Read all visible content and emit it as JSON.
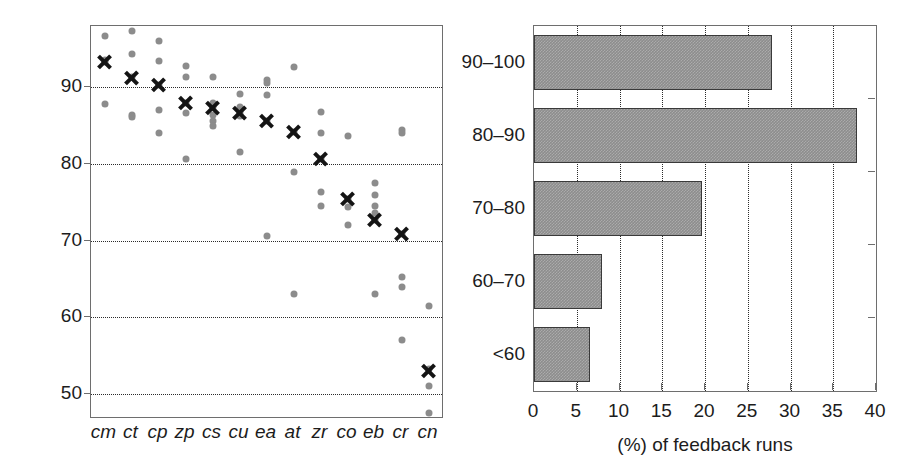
{
  "chart_data": [
    {
      "type": "scatter",
      "panel": "left",
      "title": "",
      "xlabel": "",
      "ylabel": "Feedback accuracy (%)",
      "ylim": [
        47,
        98
      ],
      "yticks": [
        50,
        60,
        70,
        80,
        90
      ],
      "grid": "horizontal-dotted",
      "legend": "none",
      "categories": [
        "cm",
        "ct",
        "cp",
        "zp",
        "cs",
        "cu",
        "ea",
        "at",
        "zr",
        "co",
        "eb",
        "cr",
        "cn"
      ],
      "series": [
        {
          "name": "mean",
          "marker": "x-cross",
          "color": "#141414",
          "values": [
            93.3,
            91.2,
            90.3,
            88.0,
            87.3,
            86.6,
            85.6,
            84.2,
            80.6,
            75.5,
            72.7,
            70.9,
            53.0
          ]
        },
        {
          "name": "individual runs",
          "marker": "dot",
          "color": "#8c8c8c",
          "points": [
            {
              "category": "cm",
              "values": [
                96.7,
                93.6,
                93.3,
                87.8
              ]
            },
            {
              "category": "ct",
              "values": [
                97.4,
                94.4,
                91.3,
                86.4,
                86.1
              ]
            },
            {
              "category": "cp",
              "values": [
                96.1,
                93.4,
                90.3,
                87.0,
                84.0
              ]
            },
            {
              "category": "zp",
              "values": [
                92.8,
                91.3,
                88.0,
                86.7,
                80.6
              ]
            },
            {
              "category": "cs",
              "values": [
                91.4,
                88.0,
                87.4,
                86.4,
                85.6,
                84.9
              ]
            },
            {
              "category": "cu",
              "values": [
                89.1,
                87.5,
                86.6,
                86.3,
                81.6
              ]
            },
            {
              "category": "ea",
              "values": [
                91.0,
                90.6,
                89.0,
                85.6,
                70.6
              ]
            },
            {
              "category": "at",
              "values": [
                92.6,
                84.2,
                79.0,
                63.0
              ]
            },
            {
              "category": "zr",
              "values": [
                86.8,
                84.0,
                80.6,
                76.3,
                74.5
              ]
            },
            {
              "category": "co",
              "values": [
                83.7,
                75.5,
                74.4,
                72.1
              ]
            },
            {
              "category": "eb",
              "values": [
                77.5,
                76.0,
                74.5,
                73.6,
                72.7,
                63.0
              ]
            },
            {
              "category": "cr",
              "values": [
                84.5,
                84.0,
                70.9,
                65.3,
                63.9,
                57.0
              ]
            },
            {
              "category": "cn",
              "values": [
                61.5,
                53.2,
                51.0,
                47.5
              ]
            }
          ]
        }
      ]
    },
    {
      "type": "bar",
      "panel": "right",
      "orientation": "horizontal",
      "title": "",
      "xlabel": "(%) of feedback runs",
      "ylabel": "",
      "categories": [
        "90–100",
        "80–90",
        "70–80",
        "60–70",
        "<60"
      ],
      "values": [
        27.8,
        37.8,
        19.7,
        8.0,
        6.5
      ],
      "xlim": [
        0,
        40
      ],
      "xticks": [
        0,
        5,
        10,
        15,
        20,
        25,
        30,
        35,
        40
      ],
      "xtick_labels": [
        "0",
        "5",
        "10",
        "15",
        "20",
        "25",
        "30",
        "35",
        "40"
      ],
      "grid": "vertical-dotted",
      "legend": "none",
      "bar_color": "#8d8d8d",
      "bar_edge_color": "#3a3a3a"
    }
  ],
  "colors": {
    "dot": "#8c8c8c",
    "cross": "#141414",
    "bar_fill": "#8d8d8d",
    "bar_edge": "#3a3a3a",
    "axis": "#6e6e6e",
    "grid": "#2b2b2b",
    "text": "#1c1c1c",
    "background": "#ffffff"
  }
}
